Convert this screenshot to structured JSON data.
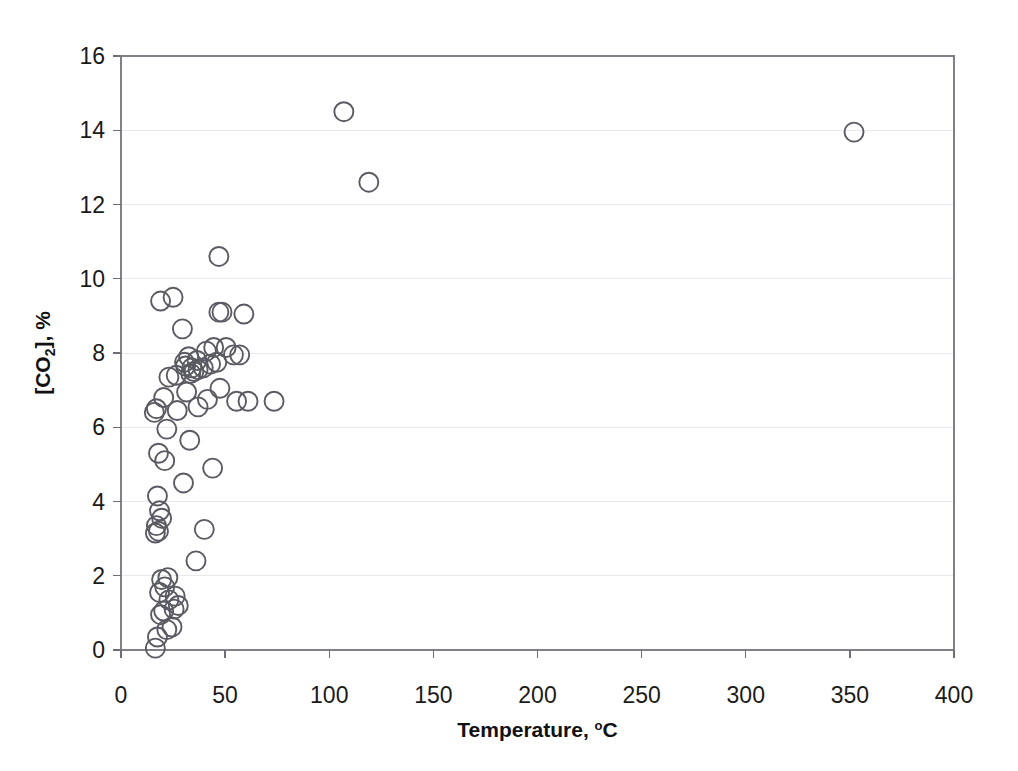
{
  "chart_data": {
    "type": "scatter",
    "title": "",
    "xlabel": "Temperature, °C",
    "ylabel": "[CO2], %",
    "xlabel_parts": {
      "text": "Temperature, ",
      "sup": "o",
      "tail": "C"
    },
    "ylabel_parts": {
      "pre": "[CO",
      "sub": "2",
      "post": "], %"
    },
    "xlim": [
      0,
      400
    ],
    "ylim": [
      0,
      16
    ],
    "xticks": [
      0,
      50,
      100,
      150,
      200,
      250,
      300,
      350,
      400
    ],
    "yticks": [
      0,
      2,
      4,
      6,
      8,
      10,
      12,
      14,
      16
    ],
    "xtick_labels": [
      "0",
      "50",
      "100",
      "150",
      "200",
      "250",
      "300",
      "350",
      "400"
    ],
    "ytick_labels": [
      "0",
      "2",
      "4",
      "6",
      "8",
      "10",
      "12",
      "14",
      "16"
    ],
    "grid": {
      "horizontal": true,
      "vertical": false
    },
    "legend": null,
    "marker": {
      "shape": "open-circle",
      "radius_px": 9.5,
      "stroke": "#5a5a62",
      "fill": "none"
    },
    "colors": {
      "gridline": "#e9e9ec",
      "frame": "#808088",
      "axis": "#6e6e76",
      "text": "#1a1a1a"
    },
    "series": [
      {
        "name": "CO2 vs Temperature",
        "points": [
          [
            16.5,
            0.05
          ],
          [
            17.5,
            0.35
          ],
          [
            22.0,
            0.55
          ],
          [
            24.5,
            0.62
          ],
          [
            19.0,
            0.95
          ],
          [
            20.5,
            1.05
          ],
          [
            25.5,
            1.1
          ],
          [
            27.5,
            1.2
          ],
          [
            23.0,
            1.35
          ],
          [
            26.0,
            1.45
          ],
          [
            18.5,
            1.55
          ],
          [
            21.0,
            1.7
          ],
          [
            19.5,
            1.9
          ],
          [
            22.5,
            1.95
          ],
          [
            36.0,
            2.4
          ],
          [
            16.5,
            3.15
          ],
          [
            18.0,
            3.2
          ],
          [
            17.0,
            3.35
          ],
          [
            40.0,
            3.25
          ],
          [
            19.5,
            3.55
          ],
          [
            18.5,
            3.75
          ],
          [
            17.5,
            4.15
          ],
          [
            30.0,
            4.5
          ],
          [
            44.0,
            4.9
          ],
          [
            21.0,
            5.1
          ],
          [
            18.0,
            5.3
          ],
          [
            33.0,
            5.65
          ],
          [
            22.0,
            5.95
          ],
          [
            16.0,
            6.4
          ],
          [
            17.0,
            6.5
          ],
          [
            27.0,
            6.45
          ],
          [
            37.0,
            6.55
          ],
          [
            41.5,
            6.75
          ],
          [
            55.5,
            6.7
          ],
          [
            61.0,
            6.7
          ],
          [
            73.5,
            6.7
          ],
          [
            20.5,
            6.8
          ],
          [
            31.5,
            6.95
          ],
          [
            47.5,
            7.05
          ],
          [
            23.0,
            7.35
          ],
          [
            26.5,
            7.4
          ],
          [
            33.5,
            7.45
          ],
          [
            35.0,
            7.5
          ],
          [
            34.0,
            7.6
          ],
          [
            31.0,
            7.65
          ],
          [
            37.0,
            7.55
          ],
          [
            39.5,
            7.6
          ],
          [
            30.5,
            7.75
          ],
          [
            36.5,
            7.8
          ],
          [
            43.0,
            7.7
          ],
          [
            46.0,
            7.75
          ],
          [
            32.5,
            7.9
          ],
          [
            54.0,
            7.95
          ],
          [
            57.0,
            7.95
          ],
          [
            41.0,
            8.05
          ],
          [
            44.5,
            8.15
          ],
          [
            50.5,
            8.15
          ],
          [
            29.5,
            8.65
          ],
          [
            47.0,
            9.1
          ],
          [
            48.5,
            9.1
          ],
          [
            59.0,
            9.05
          ],
          [
            19.0,
            9.4
          ],
          [
            25.0,
            9.5
          ],
          [
            47.0,
            10.6
          ],
          [
            119.0,
            12.6
          ],
          [
            352.0,
            13.95
          ],
          [
            107.0,
            14.5
          ]
        ]
      }
    ]
  }
}
